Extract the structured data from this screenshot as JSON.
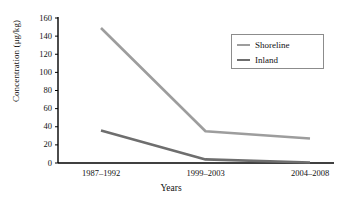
{
  "chart_data": {
    "type": "line",
    "title": "",
    "xlabel": "Years",
    "ylabel": "Concentration (μg/kg)",
    "categories": [
      "1987–1992",
      "1999–2003",
      "2004–2008"
    ],
    "series": [
      {
        "name": "Shoreline",
        "values": [
          149,
          35,
          27
        ],
        "color": "#9d9d9d"
      },
      {
        "name": "Inland",
        "values": [
          36,
          4,
          0.5
        ],
        "color": "#6e6e6e"
      }
    ],
    "ylim": [
      0,
      160
    ],
    "yticks": [
      0,
      20,
      40,
      60,
      80,
      100,
      120,
      140,
      160
    ],
    "ytick_labels": [
      "0",
      "20",
      "40",
      "60",
      "80",
      "100",
      "120",
      "140",
      "160"
    ],
    "grid": false,
    "legend_position": "upper-right",
    "axis_color": "#000000",
    "background": "#ffffff"
  },
  "legend": {
    "entries": [
      {
        "label": "Shoreline"
      },
      {
        "label": "Inland"
      }
    ]
  }
}
